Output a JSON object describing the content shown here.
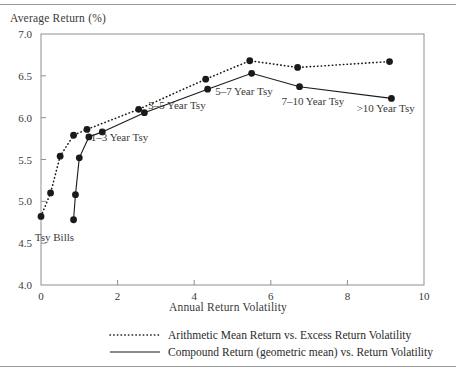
{
  "chart_data": {
    "type": "line",
    "title": "",
    "xlabel": "Annual Return Volatility",
    "ylabel": "Average Return (%)",
    "xlim": [
      0,
      10
    ],
    "ylim": [
      4.0,
      7.0
    ],
    "xticks": [
      "0",
      "2",
      "4",
      "6",
      "8",
      "10"
    ],
    "xtick_values": [
      0,
      2,
      4,
      6,
      8,
      10
    ],
    "yticks": [
      "4.0",
      "4.5",
      "5.0",
      "5.5",
      "6.0",
      "6.5",
      "7.0"
    ],
    "ytick_values": [
      4.0,
      4.5,
      5.0,
      5.5,
      6.0,
      6.5,
      7.0
    ],
    "grid": false,
    "legend_position": "below-axes",
    "series": [
      {
        "name": "Arithmetic Mean Return vs. Excess Return Volatility",
        "style": "dotted",
        "color": "#1a1a1a",
        "x": [
          0.0,
          0.25,
          0.5,
          0.85,
          1.2,
          2.55,
          4.3,
          5.45,
          6.7,
          9.1
        ],
        "y": [
          4.82,
          5.1,
          5.54,
          5.79,
          5.86,
          6.1,
          6.46,
          6.68,
          6.6,
          6.67
        ]
      },
      {
        "name": "Compound Return (geometric mean) vs. Return Volatility",
        "style": "solid",
        "color": "#1a1a1a",
        "x": [
          0.85,
          0.9,
          1.0,
          1.25,
          1.6,
          2.7,
          4.35,
          5.5,
          6.75,
          9.15
        ],
        "y": [
          4.78,
          5.08,
          5.52,
          5.77,
          5.83,
          6.06,
          6.34,
          6.53,
          6.37,
          6.23
        ]
      }
    ],
    "annotations": [
      {
        "text": "Tsy Bills",
        "x": 0.35,
        "y": 4.52
      },
      {
        "text": "1–3 Year Tsy",
        "x": 2.05,
        "y": 5.72
      },
      {
        "text": "3–5 Year Tsy",
        "x": 3.55,
        "y": 6.1
      },
      {
        "text": "5–7 Year Tsy",
        "x": 5.3,
        "y": 6.27
      },
      {
        "text": "7–10 Year Tsy",
        "x": 7.1,
        "y": 6.15
      },
      {
        "text": ">10 Year Tsy",
        "x": 9.0,
        "y": 6.07
      }
    ]
  },
  "legend": {
    "items": [
      {
        "label": "Arithmetic Mean Return vs. Excess Return Volatility",
        "style": "dotted"
      },
      {
        "label": "Compound Return (geometric mean) vs. Return Volatility",
        "style": "solid"
      }
    ]
  },
  "colors": {
    "ink": "#1a1a1a",
    "axis": "#8f8f8f",
    "text": "#3a3a3a",
    "rule": "#9a9a9a",
    "background": "#ffffff"
  }
}
